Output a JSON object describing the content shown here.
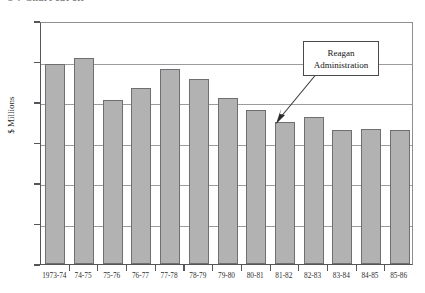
{
  "caption": {
    "text": "3-7   Chart  cut  off"
  },
  "chart_data": {
    "type": "bar",
    "title": "",
    "subtitle": "",
    "xlabel": "",
    "ylabel": "$ Millions",
    "ylim": [
      0,
      12
    ],
    "ytick_values": [
      0,
      2,
      4,
      6,
      8,
      10,
      12
    ],
    "ytick_labels": [
      "0",
      "2",
      "4",
      "6",
      "8",
      "10",
      "12"
    ],
    "grid": true,
    "legend": null,
    "categories": [
      "1973-74",
      "74-75",
      "75-76",
      "76-77",
      "77-78",
      "78-79",
      "79-80",
      "80-81",
      "81-82",
      "82-83",
      "83-84",
      "84-85",
      "85-86"
    ],
    "values": [
      9.9,
      10.15,
      8.1,
      8.7,
      9.65,
      9.15,
      8.2,
      7.6,
      7.0,
      7.25,
      6.6,
      6.65,
      6.6
    ],
    "bar_color": "#b2b2b2",
    "bar_edge_color": "#6e6f72",
    "annotations": [
      {
        "label_line1": "Reagan",
        "label_line2": "Administration",
        "points_to_category": "81-82"
      }
    ]
  }
}
